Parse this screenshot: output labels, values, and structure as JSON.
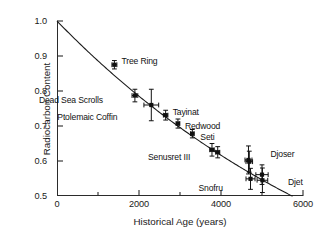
{
  "chart_data": {
    "type": "scatter",
    "title": "",
    "xlabel": "Historical Age (years)",
    "ylabel": "Radiocarbon Content",
    "xlim": [
      0,
      6000
    ],
    "ylim": [
      0.5,
      1.0
    ],
    "grid": false,
    "legend": "none",
    "xticks": [
      0,
      2000,
      4000,
      6000
    ],
    "xtick_labels": [
      "0",
      "2000",
      "4000",
      "6000"
    ],
    "xminor_ticks": [
      1000,
      3000,
      5000
    ],
    "yticks": [
      0.5,
      0.6,
      0.7,
      0.8,
      0.9,
      1.0
    ],
    "ytick_labels": [
      "0.5",
      "0.6",
      "0.7",
      "0.8",
      "0.9",
      "1.0"
    ],
    "curve": {
      "name": "radiocarbon decay curve",
      "description": "exponential decay of radiocarbon content with historical age",
      "half_life": 5730,
      "x_start": 0,
      "y_start": 1.0,
      "x_end": 5750,
      "y_end": 0.5
    },
    "points": [
      {
        "label": "Tree Ring",
        "x": 1400,
        "y": 0.875,
        "xerr": 60,
        "yerr": 0.012,
        "label_dx": 7,
        "label_dy": -4
      },
      {
        "label": "Dead Sea Scrolls",
        "x": 1900,
        "y": 0.787,
        "xerr": 70,
        "yerr": 0.018,
        "label_dx": -96,
        "label_dy": 4
      },
      {
        "label": "Ptolemaic Coffin",
        "x": 2300,
        "y": 0.76,
        "xerr": 180,
        "yerr": 0.045,
        "label_dx": -94,
        "label_dy": 12
      },
      {
        "label": "Tayinat",
        "x": 2650,
        "y": 0.731,
        "xerr": 55,
        "yerr": 0.014,
        "label_dx": 7,
        "label_dy": -3
      },
      {
        "label": "Redwood",
        "x": 2950,
        "y": 0.707,
        "xerr": 45,
        "yerr": 0.013,
        "label_dx": 7,
        "label_dy": 2
      },
      {
        "label": "Seti",
        "x": 3300,
        "y": 0.678,
        "xerr": 45,
        "yerr": 0.012,
        "label_dx": 8,
        "label_dy": 3
      },
      {
        "label": "Senusret III",
        "x": 3780,
        "y": 0.632,
        "xerr": 55,
        "yerr": 0.018,
        "label_dx": -64,
        "label_dy": 7
      },
      {
        "label": "",
        "x": 3920,
        "y": 0.625,
        "xerr": 50,
        "yerr": 0.016,
        "label_dx": 0,
        "label_dy": 0
      },
      {
        "label": "Djoser",
        "x": 4670,
        "y": 0.603,
        "xerr": 85,
        "yerr": 0.04,
        "label_dx": 22,
        "label_dy": -6
      },
      {
        "label": "",
        "x": 4690,
        "y": 0.598,
        "xerr": 80,
        "yerr": 0.03,
        "label_dx": 0,
        "label_dy": 0
      },
      {
        "label": "Snofru",
        "x": 4720,
        "y": 0.549,
        "xerr": 110,
        "yerr": 0.03,
        "label_dx": -52,
        "label_dy": 9
      },
      {
        "label": "Djet",
        "x": 5000,
        "y": 0.561,
        "xerr": 150,
        "yerr": 0.028,
        "label_dx": 26,
        "label_dy": 7
      },
      {
        "label": "",
        "x": 5010,
        "y": 0.545,
        "xerr": 130,
        "yerr": 0.035,
        "label_dx": 0,
        "label_dy": 0
      }
    ]
  },
  "style": {
    "axis_color": "#2b2b2b",
    "curve_color": "#1a1a1a",
    "marker_color": "#111111",
    "background": "#ffffff"
  }
}
